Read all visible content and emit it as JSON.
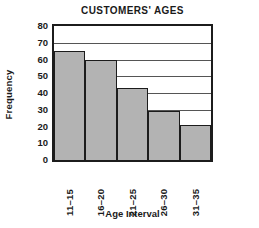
{
  "chart_data": {
    "type": "bar",
    "title": "CUSTOMERS' AGES",
    "xlabel": "Age Interval",
    "ylabel": "Frequency",
    "categories": [
      "11–15",
      "16–20",
      "21–25",
      "26–30",
      "31–35"
    ],
    "values": [
      65,
      60,
      43,
      29,
      21
    ],
    "ylim": [
      0,
      80
    ],
    "ytick_step": 10,
    "yticks": [
      0,
      10,
      20,
      30,
      40,
      50,
      60,
      70,
      80
    ],
    "ytick_labels": [
      "0",
      "10",
      "20",
      "30",
      "40",
      "50",
      "60",
      "70",
      "80"
    ],
    "grid": true,
    "grid_axis": "y",
    "legend": false,
    "bar_fill_color": "#b3b3b3",
    "bar_edge_color": "#1c1c1c",
    "axis_color": "#1c1c1c",
    "grid_color": "#555555",
    "text_color": "#1a1a1a",
    "background_color": "#ffffff",
    "bar_gap": 0,
    "xtick_rotation": -90,
    "series": [
      {
        "name": "Frequency",
        "values": [
          65,
          60,
          43,
          29,
          21
        ]
      }
    ]
  }
}
